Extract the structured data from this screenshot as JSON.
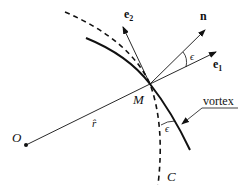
{
  "figure": {
    "labels": {
      "origin": "O",
      "point": "M",
      "radial": "r̂",
      "e1": "e",
      "e1_sub": "1",
      "e2": "e",
      "e2_sub": "2",
      "normal": "n",
      "angle_top": "ϵ",
      "angle_bottom": "ϵ",
      "curve_c": "C",
      "vortex": "vortex"
    },
    "elements": {
      "vortex_curve": "solid",
      "circle_c": "dashed"
    },
    "colors": {
      "ink": "#111111",
      "background": "#ffffff"
    }
  }
}
